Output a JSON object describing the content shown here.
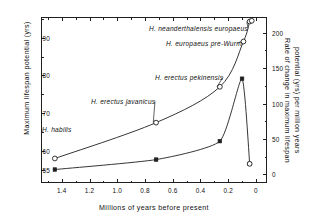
{
  "chart_data": {
    "type": "line",
    "title": "",
    "xlabel": "Millions of years before present",
    "ylabel_left": "Maximum lifespan potential (yrs)",
    "ylabel_right": "Rate of change in maximum lifespan potential (yrs) per million years",
    "xlim": [
      1.55,
      -0.08
    ],
    "x_ticks_major": [
      "1.4",
      "1.2",
      "1.0",
      "0.8",
      "0.6",
      "0.4",
      "0.2",
      "0"
    ],
    "x_tick_major_values": [
      1.4,
      1.2,
      1.0,
      0.8,
      0.6,
      0.4,
      0.2,
      0.0
    ],
    "x_tick_minor_values": [
      1.5,
      1.3,
      1.1,
      0.9,
      0.7,
      0.5,
      0.3,
      0.1
    ],
    "ylim_left": [
      51.5,
      95.5
    ],
    "y_ticks_left": [
      "90",
      "80",
      "70",
      "60",
      "55"
    ],
    "y_tick_left_values": [
      90,
      80,
      70,
      60,
      55
    ],
    "y_tick_left_minor": [
      95,
      85,
      75,
      65
    ],
    "ylim_right": [
      -12,
      222
    ],
    "y_ticks_right": [
      "200",
      "150",
      "100",
      "50",
      "0"
    ],
    "y_tick_right_values": [
      200,
      150,
      100,
      50,
      0
    ],
    "y_tick_right_minor": [
      175,
      125,
      75,
      25
    ],
    "grid": false,
    "legend_position": "none",
    "series": [
      {
        "name": "Maximum lifespan potential",
        "axis": "left",
        "marker": "open-circle",
        "points": [
          {
            "x": 1.45,
            "y": 58.0,
            "label": "H. habilis"
          },
          {
            "x": 0.72,
            "y": 67.5,
            "label": "H. erectus javanicus"
          },
          {
            "x": 0.26,
            "y": 77.0,
            "label": "H. erectus pekinensis"
          },
          {
            "x": 0.09,
            "y": 89.0,
            "label": "H. europaeus pre-Wurm"
          },
          {
            "x": 0.045,
            "y": 94.3,
            "label": "H. neanderthalensis europaeus"
          },
          {
            "x": 0.03,
            "y": 94.5,
            "label": ""
          }
        ]
      },
      {
        "name": "Rate of change in maximum lifespan potential",
        "axis": "right",
        "marker": "filled-square",
        "points": [
          {
            "x": 1.45,
            "y": 7.0,
            "label": ""
          },
          {
            "x": 0.72,
            "y": 21.0,
            "label": ""
          },
          {
            "x": 0.26,
            "y": 47.0,
            "label": ""
          },
          {
            "x": 0.1,
            "y": 135.0,
            "label": ""
          },
          {
            "x": 0.045,
            "y": 15.0,
            "label": ""
          }
        ]
      }
    ],
    "annotations": [
      {
        "text": "H. neanderthalensis europaeus",
        "leader": true
      },
      {
        "text": "H. europaeus pre-Wurm",
        "leader": true
      },
      {
        "text": "H. erectus pekinensis",
        "leader": true
      },
      {
        "text": "H. erectus javanicus",
        "leader": true
      },
      {
        "text": "H. habilis",
        "leader": false
      }
    ]
  },
  "axes": {
    "x_title": "Millions of years before present",
    "y_left_title": "Maximum lifespan potential (yrs)",
    "y_right_title_line1": "Rate of change in maximum lifespan",
    "y_right_title_line2": "potential (yrs) per million years"
  },
  "x_tick_labels": [
    "1.4",
    "1.2",
    "1.0",
    "0.8",
    "0.6",
    "0.4",
    "0.2",
    "0"
  ],
  "y_left_tick_labels": [
    "90",
    "80",
    "70",
    "60",
    "55"
  ],
  "y_right_tick_labels": [
    "200",
    "150",
    "100",
    "50",
    "0"
  ],
  "point_labels": {
    "habilis": "H. habilis",
    "javanicus": "H. erectus javanicus",
    "pekinensis": "H. erectus pekinensis",
    "pre_wurm": "H. europaeus pre-Wurm",
    "neanderthal": "H. neanderthalensis europaeus"
  },
  "colors": {
    "ink": "#1f1f1f",
    "background": "#ffffff"
  }
}
